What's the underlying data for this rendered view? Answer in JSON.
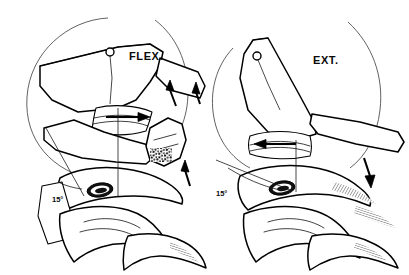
{
  "figure": {
    "background_color": "#ffffff",
    "ink_color": "#000000",
    "width": 409,
    "height": 275
  },
  "panels": [
    {
      "id": "flexion",
      "label": "FLEX.",
      "side": "left",
      "axis_marker": {
        "name": "instantaneous-axis-of-rotation",
        "glyph": "open-circle",
        "label": ""
      },
      "angle": {
        "value": "15",
        "unit": "°",
        "display": "15°"
      },
      "arc": {
        "name": "rotation-arc",
        "description": "thin circular arc indicating arc of rotation"
      },
      "arrows": [
        {
          "name": "disc-glide-arrow",
          "direction": "anterior",
          "style": "solid-filled"
        },
        {
          "name": "spinous-separation-arrow-upper",
          "direction": "up"
        },
        {
          "name": "spinous-separation-arrow-lower",
          "direction": "up"
        }
      ]
    },
    {
      "id": "extension",
      "label": "EXT.",
      "side": "right",
      "axis_marker": {
        "name": "instantaneous-axis-of-rotation",
        "glyph": "open-circle",
        "label": ""
      },
      "angle": {
        "value": "15",
        "unit": "°",
        "display": "15°"
      },
      "arc": {
        "name": "rotation-arc",
        "description": "thin circular arc indicating arc of rotation"
      },
      "arrows": [
        {
          "name": "disc-glide-arrow",
          "direction": "posterior",
          "style": "solid-filled"
        },
        {
          "name": "spinous-approximation-arrow",
          "direction": "down"
        }
      ]
    }
  ],
  "anatomy": {
    "structures": [
      "superior-vertebral-body",
      "inferior-vertebral-body",
      "intervertebral-disc",
      "spinous-process",
      "facet-joint",
      "lamina",
      "trabecular-bone"
    ],
    "texture_note": "trabecular bone rendered as dense stipple"
  }
}
